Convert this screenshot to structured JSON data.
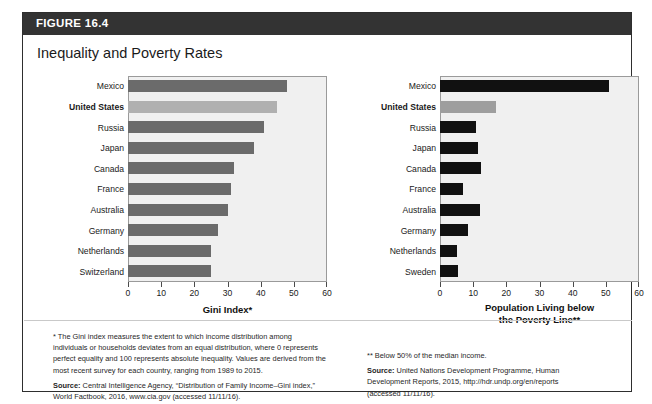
{
  "figure": {
    "label": "FIGURE 16.4",
    "title": "Inequality and Poverty Rates"
  },
  "colors": {
    "header_bar": "#333333",
    "figure_border": "#2e2e2e",
    "plot_background": "#f0f0f0",
    "plot_border": "#9a9a9a",
    "gini_bar": "#6b6b6b",
    "gini_bar_highlight": "#b0b0b0",
    "poverty_bar": "#111111",
    "poverty_bar_highlight": "#9e9e9e"
  },
  "chart_data": [
    {
      "type": "bar",
      "orientation": "horizontal",
      "title": "",
      "xlabel": "Gini Index*",
      "ylabel": "",
      "xlim": [
        0,
        60
      ],
      "xticks": [
        0,
        10,
        20,
        30,
        40,
        50,
        60
      ],
      "grid": false,
      "legend": "none",
      "highlight_category": "United States",
      "categories": [
        "Mexico",
        "United States",
        "Russia",
        "Japan",
        "Canada",
        "France",
        "Australia",
        "Germany",
        "Netherlands",
        "Switzerland"
      ],
      "values": [
        48,
        45,
        41,
        38,
        32,
        31,
        30,
        27,
        25,
        25
      ]
    },
    {
      "type": "bar",
      "orientation": "horizontal",
      "title": "",
      "xlabel": "Population Living below the Poverty Line**",
      "xlabel_line1": "Population Living below",
      "xlabel_line2": "the Poverty Line**",
      "ylabel": "",
      "xlim": [
        0,
        60
      ],
      "xticks": [
        0,
        10,
        20,
        30,
        40,
        50,
        60
      ],
      "grid": false,
      "legend": "none",
      "highlight_category": "United States",
      "categories": [
        "Mexico",
        "United States",
        "Russia",
        "Japan",
        "Canada",
        "France",
        "Australia",
        "Germany",
        "Netherlands",
        "Sweden"
      ],
      "values": [
        51,
        17,
        11,
        11.5,
        12.5,
        7,
        12,
        8.5,
        5,
        5.5
      ]
    }
  ],
  "notes": {
    "left": {
      "footnote_lines": [
        "* The Gini index measures the extent to which income distribution among",
        "individuals or households deviates from an equal distribution, where 0 represents",
        "perfect equality and 100 represents absolute inequality. Values are derived from the",
        "most recent survey for each country, ranging from 1989 to 2015."
      ],
      "source_label": "Source:",
      "source_lines": [
        " Central Intelligence Agency, “Distribution of Family Income–Gini index,”",
        "World Factbook, 2016, www.cia.gov (accessed 11/11/16)."
      ]
    },
    "right": {
      "footnote_lines": [
        "** Below 50% of the median income."
      ],
      "source_label": "Source:",
      "source_lines": [
        " United Nations Development Programme, Human",
        "Development Reports, 2015, http://hdr.undp.org/en/reports",
        "(accessed 11/11/16)."
      ]
    }
  }
}
